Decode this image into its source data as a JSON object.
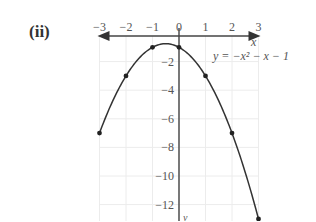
{
  "figure": {
    "part_label": "(ii)",
    "equation_label": "y = −x² − x − 1",
    "x_axis_label": "x",
    "y_axis_label": "y"
  },
  "chart_data": {
    "type": "line",
    "title": "(ii)",
    "xlabel": "x",
    "ylabel": "y",
    "series": [
      {
        "name": "y = -x^2 - x - 1",
        "x": [
          -3,
          -2,
          -1,
          0,
          1,
          2,
          3
        ],
        "y": [
          -7,
          -3,
          -1,
          -1,
          -3,
          -7,
          -13
        ]
      }
    ],
    "x_ticks": [
      "-3",
      "-2",
      "-1",
      "0",
      "1",
      "2",
      "3"
    ],
    "y_ticks": [
      "-2",
      "-4",
      "-6",
      "-8",
      "-10",
      "-12"
    ],
    "xlim": [
      -3,
      3
    ],
    "ylim": [
      -13,
      0
    ],
    "grid": true,
    "annotations": [
      "y = -x^2 - x - 1"
    ]
  }
}
